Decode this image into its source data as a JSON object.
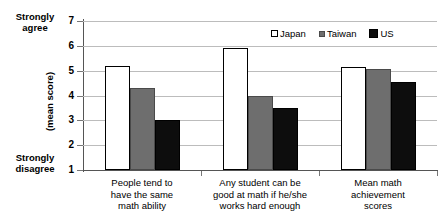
{
  "chart_data": {
    "type": "bar",
    "title": "",
    "xlabel": "",
    "ylabel": "(mean score)",
    "ylim": [
      1,
      7
    ],
    "yticks": [
      1,
      2,
      3,
      4,
      5,
      6,
      7
    ],
    "grid": true,
    "legend_position": "top-right",
    "scale_anchor_high": "Strongly\nagree",
    "scale_anchor_low": "Strongly\ndisagree",
    "categories": [
      "People tend to have the same math ability",
      "Any student can be good at math if he/she works hard enough",
      "Mean math achievement scores"
    ],
    "series": [
      {
        "name": "Japan",
        "color": "#ffffff",
        "values": [
          5.2,
          5.9,
          5.15
        ]
      },
      {
        "name": "Taiwan",
        "color": "#6e6e6e",
        "values": [
          4.3,
          4.0,
          5.05
        ]
      },
      {
        "name": "US",
        "color": "#0d0d0d",
        "values": [
          3.0,
          3.5,
          4.55
        ]
      }
    ]
  },
  "axis": {
    "anchor_high_line1": "Strongly",
    "anchor_high_line2": "agree",
    "anchor_low_line1": "Strongly",
    "anchor_low_line2": "disagree",
    "title": "(mean score)",
    "ticks": [
      "7",
      "6",
      "5",
      "4",
      "3",
      "2",
      "1"
    ]
  },
  "categories": [
    {
      "line1": "People tend to",
      "line2": "have the same",
      "line3": "math ability"
    },
    {
      "line1": "Any student can be",
      "line2": "good at math if he/she",
      "line3": "works hard enough"
    },
    {
      "line1": "Mean math",
      "line2": "achievement",
      "line3": "scores"
    }
  ],
  "legend": {
    "items": [
      {
        "label": "Japan"
      },
      {
        "label": "Taiwan"
      },
      {
        "label": "US"
      }
    ]
  }
}
